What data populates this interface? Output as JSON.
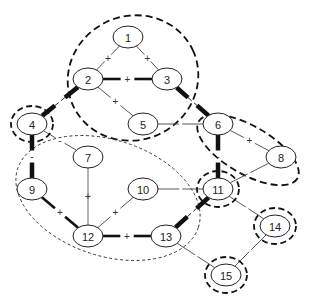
{
  "diagram": {
    "type": "network-graph",
    "colors": {
      "stroke": "#111111",
      "thin_edge": "#444444",
      "background": "#ffffff"
    },
    "nodes": [
      {
        "id": "1",
        "label": "1",
        "x": 128,
        "y": 37,
        "highlighted": false
      },
      {
        "id": "2",
        "label": "2",
        "x": 88,
        "y": 79,
        "highlighted": false
      },
      {
        "id": "3",
        "label": "3",
        "x": 167,
        "y": 79,
        "highlighted": false
      },
      {
        "id": "4",
        "label": "4",
        "x": 32,
        "y": 124,
        "highlighted": true
      },
      {
        "id": "5",
        "label": "5",
        "x": 143,
        "y": 124,
        "highlighted": false
      },
      {
        "id": "6",
        "label": "6",
        "x": 218,
        "y": 124,
        "highlighted": false
      },
      {
        "id": "7",
        "label": "7",
        "x": 88,
        "y": 157,
        "highlighted": false
      },
      {
        "id": "8",
        "label": "8",
        "x": 281,
        "y": 157,
        "highlighted": false
      },
      {
        "id": "9",
        "label": "9",
        "x": 32,
        "y": 189,
        "highlighted": false
      },
      {
        "id": "10",
        "label": "10",
        "x": 143,
        "y": 189,
        "highlighted": false
      },
      {
        "id": "11",
        "label": "11",
        "x": 218,
        "y": 189,
        "highlighted": true
      },
      {
        "id": "12",
        "label": "12",
        "x": 88,
        "y": 236,
        "highlighted": false
      },
      {
        "id": "13",
        "label": "13",
        "x": 166,
        "y": 236,
        "highlighted": false
      },
      {
        "id": "14",
        "label": "14",
        "x": 275,
        "y": 226,
        "highlighted": true
      },
      {
        "id": "15",
        "label": "15",
        "x": 226,
        "y": 275,
        "highlighted": true
      }
    ],
    "edges": [
      {
        "from": "1",
        "to": "2",
        "sign": "+",
        "weight": "thin",
        "style": "dashed"
      },
      {
        "from": "1",
        "to": "3",
        "sign": "+",
        "weight": "thin",
        "style": "dashed"
      },
      {
        "from": "2",
        "to": "3",
        "sign": "+",
        "weight": "thick",
        "style": "dashed"
      },
      {
        "from": "2",
        "to": "5",
        "sign": "+",
        "weight": "thin",
        "style": "dashed"
      },
      {
        "from": "2",
        "to": "4",
        "sign": "",
        "weight": "heavy",
        "style": "dashed"
      },
      {
        "from": "3",
        "to": "6",
        "sign": "",
        "weight": "heavy",
        "style": "dashed"
      },
      {
        "from": "5",
        "to": "6",
        "sign": "",
        "weight": "thin",
        "style": "dashed"
      },
      {
        "from": "4",
        "to": "9",
        "sign": "-",
        "weight": "heavy",
        "style": "dashed"
      },
      {
        "from": "4",
        "to": "7",
        "sign": "-",
        "weight": "thin",
        "style": "dashed"
      },
      {
        "from": "6",
        "to": "8",
        "sign": "+",
        "weight": "thin",
        "style": "dashed"
      },
      {
        "from": "6",
        "to": "11",
        "sign": "-",
        "weight": "heavy",
        "style": "dashed"
      },
      {
        "from": "8",
        "to": "11",
        "sign": "",
        "weight": "thin",
        "style": "dashed"
      },
      {
        "from": "7",
        "to": "12",
        "sign": "+",
        "weight": "thin",
        "style": "solid"
      },
      {
        "from": "9",
        "to": "12",
        "sign": "+",
        "weight": "thick",
        "style": "dashed"
      },
      {
        "from": "10",
        "to": "12",
        "sign": "+",
        "weight": "thin",
        "style": "dashed"
      },
      {
        "from": "10",
        "to": "11",
        "sign": "",
        "weight": "thin",
        "style": "dashed"
      },
      {
        "from": "12",
        "to": "13",
        "sign": "+",
        "weight": "thick",
        "style": "dashed"
      },
      {
        "from": "13",
        "to": "11",
        "sign": "",
        "weight": "heavy",
        "style": "dashed"
      },
      {
        "from": "11",
        "to": "14",
        "sign": "",
        "weight": "thin",
        "style": "dashed"
      },
      {
        "from": "13",
        "to": "15",
        "sign": "",
        "weight": "thin",
        "style": "dashed"
      },
      {
        "from": "14",
        "to": "15",
        "sign": "",
        "weight": "thin",
        "style": "dashed"
      }
    ],
    "clusters": [
      {
        "id": "cluster-top",
        "members": [
          "1",
          "2",
          "3",
          "5"
        ],
        "style": "dashed-bold"
      },
      {
        "id": "cluster-right",
        "members": [
          "6",
          "8"
        ],
        "style": "dashed-bold"
      },
      {
        "id": "cluster-left",
        "members": [
          "7",
          "9",
          "10",
          "12",
          "13"
        ],
        "style": "dashed-thin"
      }
    ]
  }
}
